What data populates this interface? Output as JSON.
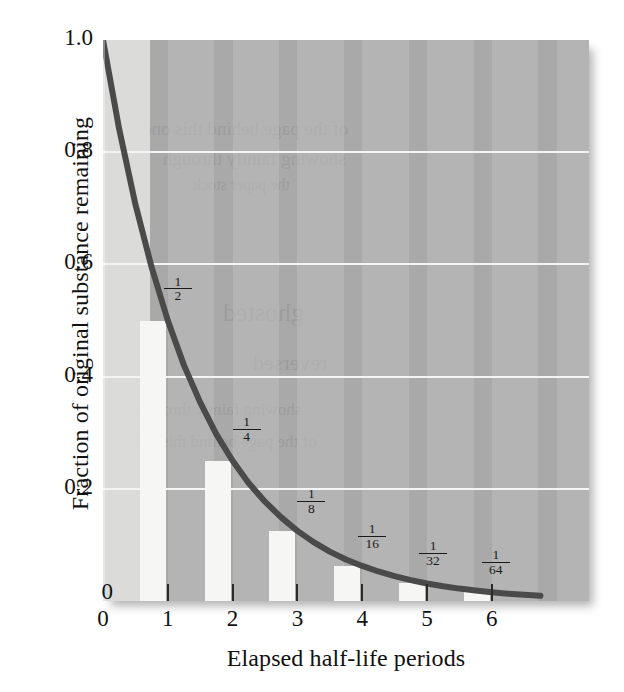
{
  "figure": {
    "background_color": "#ffffff",
    "panel_color": "#a9a9a9",
    "band_color_light": "#bdbdbd",
    "gridline_color": "#f4f4f4",
    "bar_color": "#f6f6f4",
    "curve_color": "#4a4a4a",
    "text_color": "#111111"
  },
  "chart_data": {
    "type": "line",
    "title": "",
    "subtitle": "",
    "xlabel": "Elapsed half-life periods",
    "ylabel": "Fraction of original substance remaining",
    "xlim": [
      0,
      7.5
    ],
    "ylim": [
      0,
      1.0
    ],
    "grid": true,
    "legend": "none",
    "x_ticks": [
      0,
      1,
      2,
      3,
      4,
      5,
      6
    ],
    "x_tick_labels": [
      "0",
      "1",
      "2",
      "3",
      "4",
      "5",
      "6"
    ],
    "y_ticks": [
      0,
      0.2,
      0.4,
      0.6,
      0.8,
      1.0
    ],
    "y_tick_labels": [
      "0",
      "0.2",
      "0.4",
      "0.6",
      "0.8",
      "1.0"
    ],
    "series": [
      {
        "name": "Fraction remaining",
        "type": "line",
        "formula": "y = 0.5^x",
        "color": "#4a4a4a",
        "x": [
          0,
          0.25,
          0.5,
          0.75,
          1,
          1.25,
          1.5,
          1.75,
          2,
          2.25,
          2.5,
          2.75,
          3,
          3.25,
          3.5,
          3.75,
          4,
          4.25,
          4.5,
          4.75,
          5,
          5.25,
          5.5,
          5.75,
          6,
          6.25,
          6.5,
          6.75
        ],
        "y": [
          1.0,
          0.841,
          0.707,
          0.595,
          0.5,
          0.42,
          0.354,
          0.297,
          0.25,
          0.21,
          0.177,
          0.149,
          0.125,
          0.105,
          0.088,
          0.074,
          0.0625,
          0.0526,
          0.0442,
          0.0372,
          0.03125,
          0.0263,
          0.0221,
          0.0186,
          0.015625,
          0.0131,
          0.011,
          0.0093
        ]
      },
      {
        "name": "Fraction remaining (bars)",
        "type": "bar",
        "color": "#f6f6f4",
        "categories": [
          "0",
          "1",
          "2",
          "3",
          "4",
          "5",
          "6"
        ],
        "values": [
          1.0,
          0.5,
          0.25,
          0.125,
          0.0625,
          0.03125,
          0.015625
        ]
      }
    ],
    "annotations": [
      {
        "label": "1/2",
        "numerator": "1",
        "denominator": "2",
        "x": 1,
        "y": 0.5
      },
      {
        "label": "1/4",
        "numerator": "1",
        "denominator": "4",
        "x": 2,
        "y": 0.25
      },
      {
        "label": "1/8",
        "numerator": "1",
        "denominator": "8",
        "x": 3,
        "y": 0.125
      },
      {
        "label": "1/16",
        "numerator": "1",
        "denominator": "16",
        "x": 4,
        "y": 0.0625
      },
      {
        "label": "1/32",
        "numerator": "1",
        "denominator": "32",
        "x": 5,
        "y": 0.03125
      },
      {
        "label": "1/64",
        "numerator": "1",
        "denominator": "64",
        "x": 6,
        "y": 0.015625
      }
    ]
  },
  "bleed_text": {
    "line1": "of the page behind this one",
    "line2": "showing faintly through",
    "line3": "the paper stock",
    "line4": "ghosted",
    "line5": "reversed"
  }
}
